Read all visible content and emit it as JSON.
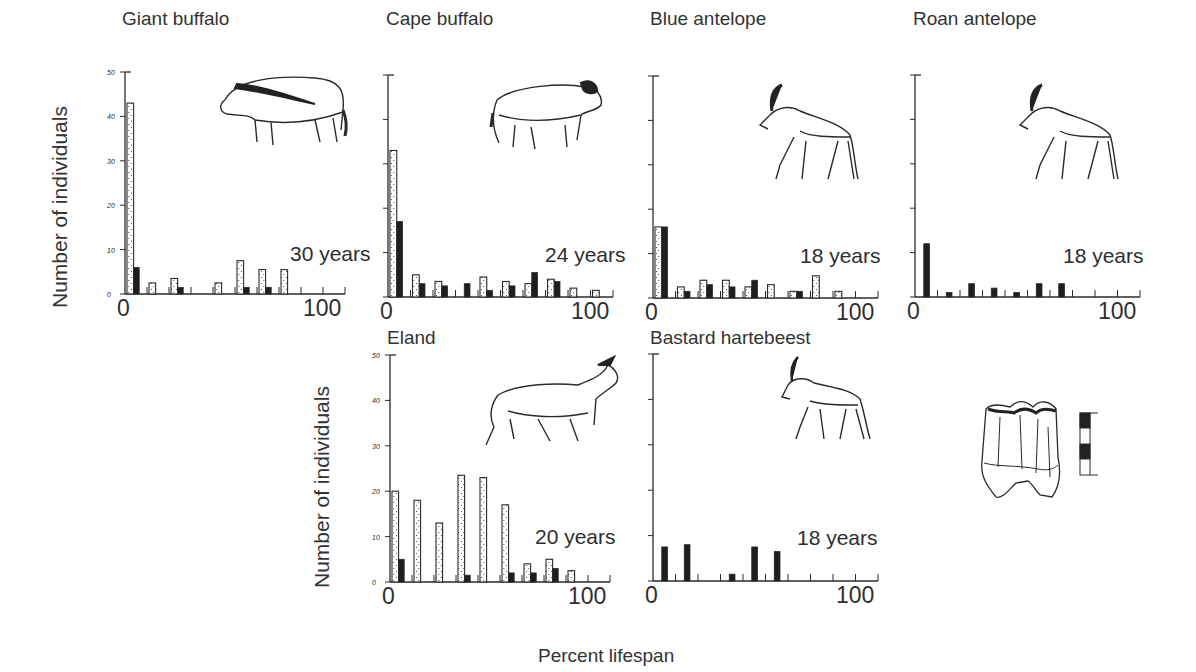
{
  "figure": {
    "ylabel": "Number of individuals",
    "xlabel": "Percent lifespan",
    "x_tick_min": "0",
    "x_tick_max": "100",
    "y_ticks": [
      "0",
      "10",
      "20",
      "30",
      "40",
      "50"
    ],
    "legend_note": "Stippled bars and solid bars represent two sample groups per age class"
  },
  "chart_data": [
    {
      "type": "bar",
      "title": "Giant buffalo",
      "annotation": "30 years",
      "xlabel": "Percent lifespan",
      "ylabel": "Number of individuals",
      "xlim": [
        0,
        100
      ],
      "ylim": [
        0,
        50
      ],
      "categories": [
        0,
        10,
        20,
        30,
        40,
        50,
        60,
        70,
        80,
        90
      ],
      "series": [
        {
          "name": "stippled",
          "values": [
            43,
            2.5,
            3.5,
            0,
            2.5,
            7.5,
            5.5,
            5.5,
            0,
            0
          ]
        },
        {
          "name": "solid",
          "values": [
            6,
            0,
            1.5,
            0,
            0,
            1.5,
            1.5,
            0,
            0,
            0
          ]
        }
      ]
    },
    {
      "type": "bar",
      "title": "Cape buffalo",
      "annotation": "24 years",
      "xlabel": "Percent lifespan",
      "ylabel": "Number of individuals",
      "xlim": [
        0,
        100
      ],
      "ylim": [
        0,
        50
      ],
      "categories": [
        0,
        10,
        20,
        30,
        40,
        50,
        60,
        70,
        80,
        90
      ],
      "series": [
        {
          "name": "stippled",
          "values": [
            33,
            5,
            3.5,
            0,
            4.5,
            3.5,
            3,
            4,
            2,
            1.5
          ]
        },
        {
          "name": "solid",
          "values": [
            17,
            3,
            2.5,
            3,
            1.5,
            2.5,
            5.5,
            3.5,
            0,
            0
          ]
        }
      ]
    },
    {
      "type": "bar",
      "title": "Blue antelope",
      "annotation": "18 years",
      "xlabel": "Percent lifespan",
      "ylabel": "Number of individuals",
      "xlim": [
        0,
        100
      ],
      "ylim": [
        0,
        50
      ],
      "categories": [
        0,
        10,
        20,
        30,
        40,
        50,
        60,
        70,
        80,
        90
      ],
      "series": [
        {
          "name": "stippled",
          "values": [
            16,
            2.5,
            4,
            4,
            2.5,
            3,
            1.5,
            5,
            1.5,
            0
          ]
        },
        {
          "name": "solid",
          "values": [
            16,
            1.5,
            3,
            2.5,
            4,
            0,
            1.5,
            0,
            0,
            0
          ]
        }
      ]
    },
    {
      "type": "bar",
      "title": "Roan antelope",
      "annotation": "18 years",
      "xlabel": "Percent lifespan",
      "ylabel": "Number of individuals",
      "xlim": [
        0,
        100
      ],
      "ylim": [
        0,
        50
      ],
      "categories": [
        0,
        10,
        20,
        30,
        40,
        50,
        60,
        70,
        80,
        90
      ],
      "series": [
        {
          "name": "stippled",
          "values": [
            0,
            0,
            0,
            0,
            0,
            0,
            0,
            0,
            0,
            0
          ]
        },
        {
          "name": "solid",
          "values": [
            12,
            1,
            3,
            2,
            1,
            3,
            3,
            0,
            0,
            0
          ]
        }
      ]
    },
    {
      "type": "bar",
      "title": "Eland",
      "annotation": "20 years",
      "xlabel": "Percent lifespan",
      "ylabel": "Number of individuals",
      "xlim": [
        0,
        100
      ],
      "ylim": [
        0,
        50
      ],
      "categories": [
        0,
        10,
        20,
        30,
        40,
        50,
        60,
        70,
        80,
        90
      ],
      "series": [
        {
          "name": "stippled",
          "values": [
            20,
            18,
            13,
            23.5,
            23,
            17,
            4,
            5,
            2.5,
            0
          ]
        },
        {
          "name": "solid",
          "values": [
            5,
            0,
            0,
            1.5,
            0,
            2,
            2,
            3,
            0,
            0
          ]
        }
      ]
    },
    {
      "type": "bar",
      "title": "Bastard hartebeest",
      "annotation": "18 years",
      "xlabel": "Percent lifespan",
      "ylabel": "Number of individuals",
      "xlim": [
        0,
        100
      ],
      "ylim": [
        0,
        50
      ],
      "categories": [
        0,
        10,
        20,
        30,
        40,
        50,
        60,
        70,
        80,
        90
      ],
      "series": [
        {
          "name": "stippled",
          "values": [
            0,
            0,
            0,
            0,
            0,
            0,
            0,
            0,
            0,
            0
          ]
        },
        {
          "name": "solid",
          "values": [
            7.5,
            8,
            0,
            1.5,
            7.5,
            6.5,
            0,
            0,
            0,
            0
          ]
        }
      ]
    }
  ],
  "panels": [
    {
      "id": "giant-buffalo",
      "title": "Giant buffalo",
      "annotation": "30 years",
      "show_y_numbers": true
    },
    {
      "id": "cape-buffalo",
      "title": "Cape buffalo",
      "annotation": "24 years",
      "show_y_numbers": false
    },
    {
      "id": "blue-antelope",
      "title": "Blue antelope",
      "annotation": "18 years",
      "show_y_numbers": false
    },
    {
      "id": "roan-antelope",
      "title": "Roan antelope",
      "annotation": "18 years",
      "show_y_numbers": false
    },
    {
      "id": "eland",
      "title": "Eland",
      "annotation": "20 years",
      "show_y_numbers": true
    },
    {
      "id": "bastard-hartebeest",
      "title": "Bastard hartebeest",
      "annotation": "18 years",
      "show_y_numbers": false
    }
  ],
  "colors": {
    "ink": "#2a2a2a",
    "stipple_fill": "#ffffff",
    "solid_fill": "#1e1e1e"
  }
}
